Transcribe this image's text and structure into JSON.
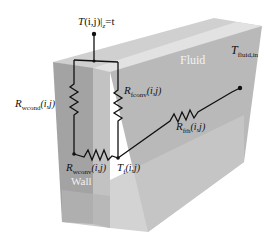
{
  "diagram": {
    "regions": {
      "fluid_label": "Fluid",
      "wall_label": "Wall"
    },
    "nodes": {
      "top": {
        "main": "T",
        "args": "(i,j)",
        "bar": "|",
        "sub": "z",
        "suffix": "=t"
      },
      "fluid_node": {
        "main": "T",
        "sub": "f",
        "args": "(i,j)"
      },
      "fluid_inlet": {
        "main": "T",
        "sub": "fluid,in"
      }
    },
    "resistors": {
      "wcond": {
        "main": "R",
        "sub": "wcond",
        "args": "(i,j)"
      },
      "fconv": {
        "main": "R",
        "sub": "fconv",
        "args": "(i,j)"
      },
      "wconv": {
        "main": "R",
        "sub": "wconv",
        "args": "(i,j)"
      },
      "fth": {
        "main": "R",
        "sub": "fth",
        "args": "(i,j)"
      }
    },
    "colors": {
      "wall_front": "#a6a6a6",
      "fluid_front": "#bdbdbd",
      "top_face": "#d4d4d4",
      "side_face": "#c9c9c9",
      "wire": "#111111"
    }
  }
}
